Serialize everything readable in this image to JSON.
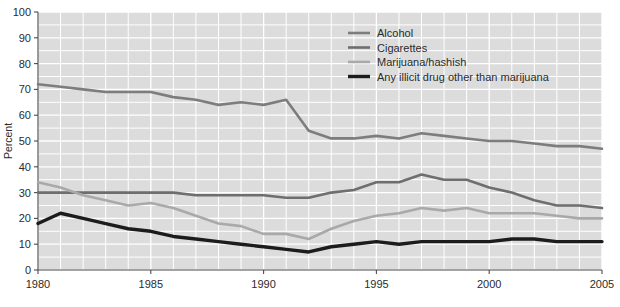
{
  "chart_data": {
    "type": "line",
    "title": "",
    "xlabel": "",
    "ylabel": "Percent",
    "xlim": [
      1980,
      2005
    ],
    "ylim": [
      0,
      100
    ],
    "grid": true,
    "legend_position": "top-right",
    "x_ticks": [
      "1980",
      "1985",
      "1990",
      "1995",
      "2000",
      "2005"
    ],
    "x_tick_values": [
      1980,
      1985,
      1990,
      1995,
      2000,
      2005
    ],
    "y_ticks": [
      "0",
      "10",
      "20",
      "30",
      "40",
      "50",
      "60",
      "70",
      "80",
      "90",
      "100"
    ],
    "y_tick_values": [
      0,
      10,
      20,
      30,
      40,
      50,
      60,
      70,
      80,
      90,
      100
    ],
    "x": [
      1980,
      1981,
      1982,
      1983,
      1984,
      1985,
      1986,
      1987,
      1988,
      1989,
      1990,
      1991,
      1992,
      1993,
      1994,
      1995,
      1996,
      1997,
      1998,
      1999,
      2000,
      2001,
      2002,
      2003,
      2004,
      2005
    ],
    "series": [
      {
        "name": "Alcohol",
        "color": "#7d7d7d",
        "width": 2.6,
        "values": [
          72,
          71,
          70,
          69,
          69,
          69,
          67,
          66,
          64,
          65,
          64,
          66,
          54,
          51,
          51,
          52,
          51,
          53,
          52,
          51,
          50,
          50,
          49,
          48,
          48,
          47
        ]
      },
      {
        "name": "Cigarettes",
        "color": "#6e6e6e",
        "width": 2.6,
        "values": [
          30,
          30,
          30,
          30,
          30,
          30,
          30,
          29,
          29,
          29,
          29,
          28,
          28,
          30,
          31,
          34,
          34,
          37,
          35,
          35,
          32,
          30,
          27,
          25,
          25,
          24
        ]
      },
      {
        "name": "Marijuana/hashish",
        "color": "#a9a9a9",
        "width": 2.6,
        "values": [
          34,
          32,
          29,
          27,
          25,
          26,
          24,
          21,
          18,
          17,
          14,
          14,
          12,
          16,
          19,
          21,
          22,
          24,
          23,
          24,
          22,
          22,
          22,
          21,
          20,
          20
        ]
      },
      {
        "name": "Any illicit drug other than marijuana",
        "color": "#1c1c1c",
        "width": 3.4,
        "values": [
          18,
          22,
          20,
          18,
          16,
          15,
          13,
          12,
          11,
          10,
          9,
          8,
          7,
          9,
          10,
          11,
          10,
          11,
          11,
          11,
          11,
          12,
          12,
          11,
          11,
          11
        ]
      }
    ]
  },
  "legend": {
    "items": [
      {
        "label": "Alcohol"
      },
      {
        "label": "Cigarettes"
      },
      {
        "label": "Marijuana/hashish"
      },
      {
        "label": "Any illicit drug other than marijuana"
      }
    ]
  },
  "colors": {
    "plot_background": "#dcdcdc",
    "gridline": "#ffffff",
    "axis": "#4a4a4a",
    "page_background": "#ffffff",
    "text": "#2b2b2b"
  }
}
